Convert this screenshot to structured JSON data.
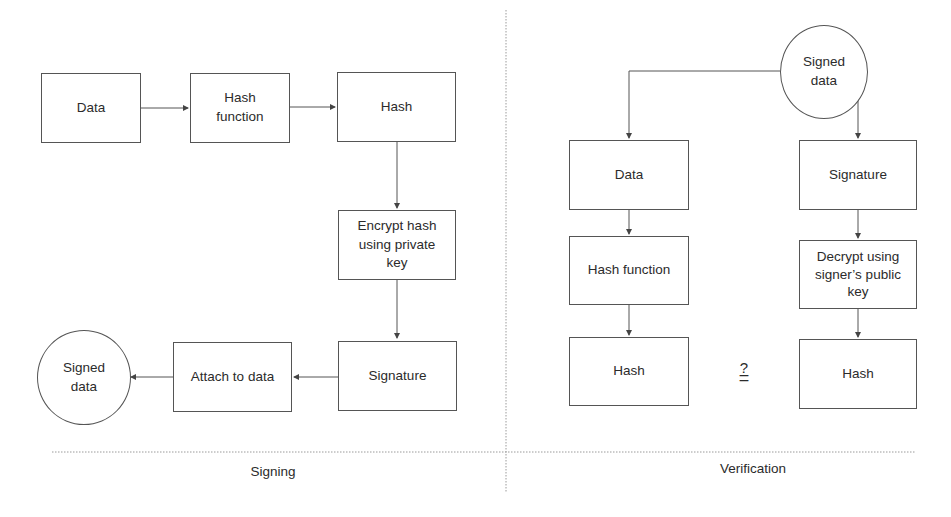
{
  "diagram": {
    "signing": {
      "section_label": "Signing",
      "nodes": {
        "data": "Data",
        "hash_function": "Hash\nfunction",
        "hash": "Hash",
        "encrypt": "Encrypt hash\nusing private\nkey",
        "signature": "Signature",
        "attach": "Attach to data",
        "signed_data": "Signed\ndata"
      },
      "edges": [
        [
          "data",
          "hash_function"
        ],
        [
          "hash_function",
          "hash"
        ],
        [
          "hash",
          "encrypt"
        ],
        [
          "encrypt",
          "signature"
        ],
        [
          "signature",
          "attach"
        ],
        [
          "attach",
          "signed_data"
        ]
      ]
    },
    "verification": {
      "section_label": "Verification",
      "nodes": {
        "signed_data": "Signed\ndata",
        "data": "Data",
        "hash_function": "Hash function",
        "hash_left": "Hash",
        "signature": "Signature",
        "decrypt": "Decrypt using\nsigner’s public\nkey",
        "hash_right": "Hash"
      },
      "comparison": {
        "question": "?",
        "equals": "="
      },
      "edges": [
        [
          "signed_data",
          "data"
        ],
        [
          "signed_data",
          "signature"
        ],
        [
          "data",
          "hash_function"
        ],
        [
          "hash_function",
          "hash_left"
        ],
        [
          "signature",
          "decrypt"
        ],
        [
          "decrypt",
          "hash_right"
        ]
      ]
    },
    "colors": {
      "stroke": "#555555",
      "text": "#2b2b2b",
      "divider": "#9a9a9a"
    }
  }
}
